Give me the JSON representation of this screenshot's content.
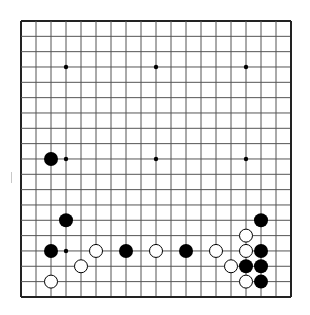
{
  "board": {
    "size": 19,
    "origin_x": 21,
    "origin_y": 21,
    "spacing_x": 15.0,
    "spacing_y": 15.33,
    "line_color": "#555555",
    "border_color": "#222222",
    "background": "#ffffff",
    "hoshi": [
      [
        3,
        3
      ],
      [
        9,
        3
      ],
      [
        15,
        3
      ],
      [
        3,
        9
      ],
      [
        9,
        9
      ],
      [
        15,
        9
      ],
      [
        3,
        15
      ],
      [
        9,
        15
      ],
      [
        15,
        15
      ]
    ],
    "stone_radius": 7,
    "stones": {
      "black": [
        [
          2,
          9
        ],
        [
          3,
          13
        ],
        [
          16,
          13
        ],
        [
          2,
          15
        ],
        [
          7,
          15
        ],
        [
          11,
          15
        ],
        [
          16,
          15
        ],
        [
          15,
          16
        ],
        [
          16,
          16
        ],
        [
          16,
          17
        ]
      ],
      "white": [
        [
          15,
          14
        ],
        [
          5,
          15
        ],
        [
          9,
          15
        ],
        [
          13,
          15
        ],
        [
          15,
          15
        ],
        [
          4,
          16
        ],
        [
          14,
          16
        ],
        [
          2,
          17
        ],
        [
          15,
          17
        ]
      ]
    },
    "colors": {
      "black_stone": "#000000",
      "white_stone": "#ffffff",
      "white_outline": "#000000"
    }
  }
}
